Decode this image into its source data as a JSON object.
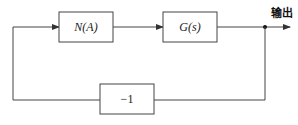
{
  "diagram": {
    "type": "block-diagram",
    "blocks": [
      {
        "id": "nonlinear",
        "label": "N(A)"
      },
      {
        "id": "plant",
        "label": "G(s)"
      },
      {
        "id": "feedback",
        "label": "−1"
      }
    ],
    "output_label": "输出",
    "connections": [
      {
        "from": "feedback-loop",
        "to": "nonlinear"
      },
      {
        "from": "nonlinear",
        "to": "plant"
      },
      {
        "from": "plant",
        "to": "output"
      },
      {
        "from": "output-junction",
        "to": "feedback"
      },
      {
        "from": "feedback",
        "to": "nonlinear"
      }
    ]
  },
  "colors": {
    "line": "#444444",
    "background": "#ffffff"
  }
}
